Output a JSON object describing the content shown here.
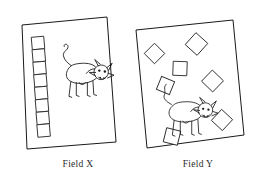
{
  "figure": {
    "type": "diagram",
    "background_color": "#ffffff",
    "line_color": "#1a1a1a",
    "canvas": {
      "width": 253,
      "height": 179
    }
  },
  "fields": [
    {
      "id": "field-x",
      "label": "Field X",
      "label_x": 78,
      "label_y": 167,
      "outline": "22,25 107,17 116,142 27,149",
      "rotation_deg": -5,
      "shape_count": 8,
      "shape_arrangement": "single vertical column along left edge",
      "squares": [
        {
          "cx": 38.0,
          "cy": 43.0,
          "size": 12.5,
          "rotate": -5
        },
        {
          "cx": 38.8,
          "cy": 55.5,
          "size": 12.5,
          "rotate": -5
        },
        {
          "cx": 39.6,
          "cy": 68.0,
          "size": 12.5,
          "rotate": -5
        },
        {
          "cx": 40.4,
          "cy": 80.5,
          "size": 12.5,
          "rotate": -5
        },
        {
          "cx": 41.2,
          "cy": 93.0,
          "size": 12.5,
          "rotate": -5
        },
        {
          "cx": 42.0,
          "cy": 105.5,
          "size": 12.5,
          "rotate": -5
        },
        {
          "cx": 42.8,
          "cy": 118.0,
          "size": 12.5,
          "rotate": -5
        },
        {
          "cx": 43.6,
          "cy": 130.5,
          "size": 12.5,
          "rotate": -5
        }
      ],
      "cow": {
        "x": 57,
        "y": 43,
        "scale": 0.92,
        "facing": "right"
      }
    },
    {
      "id": "field-y",
      "label": "Field Y",
      "label_x": 198,
      "label_y": 167,
      "outline": "136,30 233,20 244,135 147,148",
      "rotation_deg": -6,
      "shape_count": 7,
      "shape_arrangement": "scattered across the field",
      "squares": [
        {
          "cx": 196.5,
          "cy": 44.0,
          "size": 16.0,
          "rotate": 42
        },
        {
          "cx": 154.5,
          "cy": 53.5,
          "size": 14.5,
          "rotate": 45
        },
        {
          "cx": 180.0,
          "cy": 68.5,
          "size": 14.0,
          "rotate": 2
        },
        {
          "cx": 212.5,
          "cy": 81.0,
          "size": 15.5,
          "rotate": 44
        },
        {
          "cx": 165.5,
          "cy": 85.5,
          "size": 14.0,
          "rotate": 22
        },
        {
          "cx": 222.0,
          "cy": 120.0,
          "size": 15.0,
          "rotate": 43
        },
        {
          "cx": 172.0,
          "cy": 136.5,
          "size": 14.5,
          "rotate": 14
        }
      ],
      "cow": {
        "x": 175,
        "y": 100,
        "scale": 0.88,
        "facing": "right"
      }
    }
  ],
  "cow_parts": {
    "body": "body-outline",
    "head": "head-outline",
    "horns": "horn-pair",
    "ears": "ear-pair",
    "eyes": "eye-pair",
    "muzzle": "muzzle",
    "legs": "leg-group",
    "tail": "tail-curve"
  }
}
